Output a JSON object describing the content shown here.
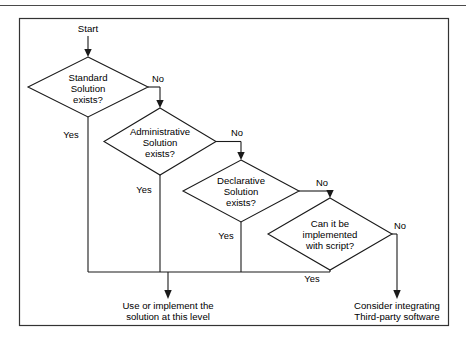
{
  "diagram": {
    "type": "flowchart",
    "start_label": "Start",
    "yes_label": "Yes",
    "no_label": "No",
    "decisions": [
      {
        "id": "standard",
        "lines": [
          "Standard",
          "Solution",
          "exists?"
        ],
        "line1": "Standard",
        "line2": "Solution",
        "line3": "exists?",
        "yes": "Yes",
        "no": "No"
      },
      {
        "id": "administrative",
        "lines": [
          "Administrative",
          "Solution",
          "exists?"
        ],
        "line1": "Administrative",
        "line2": "Solution",
        "line3": "exists?",
        "yes": "Yes",
        "no": "No"
      },
      {
        "id": "declarative",
        "lines": [
          "Declarative",
          "Solution",
          "exists?"
        ],
        "line1": "Declarative",
        "line2": "Solution",
        "line3": "exists?",
        "yes": "Yes",
        "no": "No"
      },
      {
        "id": "script",
        "lines": [
          "Can it be",
          "implemented",
          "with script?"
        ],
        "line1": "Can it be",
        "line2": "implemented",
        "line3": "with script?",
        "yes": "Yes",
        "no": "No"
      }
    ],
    "terminals": [
      {
        "id": "use-implement",
        "line1": "Use or implement the",
        "line2": "solution at this level"
      },
      {
        "id": "third-party",
        "line1": "Consider integrating",
        "line2": "Third-party software"
      }
    ],
    "colors": {
      "stroke": "#1a1a1a",
      "frame": "#333333",
      "background": "#ffffff",
      "text": "#000000"
    }
  }
}
